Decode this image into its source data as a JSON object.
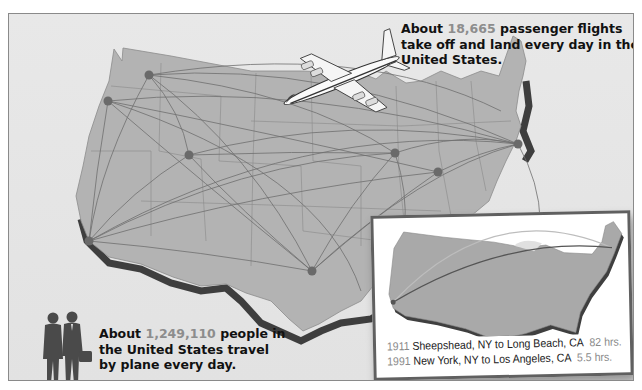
{
  "callouts": {
    "flights": {
      "prefix": "About ",
      "number": "18,665",
      "suffix": " passenger flights take off and land every day in the United States."
    },
    "travelers": {
      "prefix": "About ",
      "number": "1,249,110",
      "suffix": " people in the United States travel by plane every day."
    }
  },
  "inset": {
    "routes": [
      {
        "year": "1911",
        "route": "Sheepshead, NY to Long Beach, CA",
        "duration": "82 hrs.",
        "color": "#bdbdbd"
      },
      {
        "year": "1991",
        "route": "New York, NY  to Los Angeles, CA",
        "duration": "5.5 hrs.",
        "color": "#555555"
      }
    ]
  },
  "map": {
    "hubs": [
      {
        "name": "hub-portland",
        "x": 107,
        "y": 100
      },
      {
        "name": "hub-seattle",
        "x": 148,
        "y": 74
      },
      {
        "name": "hub-salt-lake",
        "x": 188,
        "y": 154
      },
      {
        "name": "hub-los-angeles",
        "x": 88,
        "y": 240
      },
      {
        "name": "hub-dallas",
        "x": 311,
        "y": 270
      },
      {
        "name": "hub-chicago",
        "x": 394,
        "y": 152
      },
      {
        "name": "hub-ohio",
        "x": 437,
        "y": 171
      },
      {
        "name": "hub-new-york",
        "x": 517,
        "y": 143
      }
    ],
    "colors": {
      "land": "#b3b3b3",
      "edge": "#4a4a4a",
      "route": "#6e6e6e",
      "hub": "#6a6a6a",
      "background": "#e6e6e6"
    }
  }
}
